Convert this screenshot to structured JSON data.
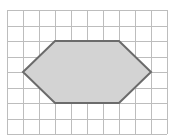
{
  "diagram": {
    "type": "grid-polygon",
    "grid": {
      "columns": 10,
      "rows": 8,
      "origin_px": [
        7,
        10
      ],
      "cell_w_px": 16,
      "cell_h_px": 15.5,
      "line_color": "#bdbdbd"
    },
    "polygon": {
      "name": "hexagon",
      "vertices_grid": [
        [
          1,
          4
        ],
        [
          3,
          2
        ],
        [
          7,
          2
        ],
        [
          9,
          4
        ],
        [
          7,
          6
        ],
        [
          3,
          6
        ]
      ],
      "fill_color": "#d3d3d3",
      "stroke_color": "#6b6b6b"
    }
  }
}
